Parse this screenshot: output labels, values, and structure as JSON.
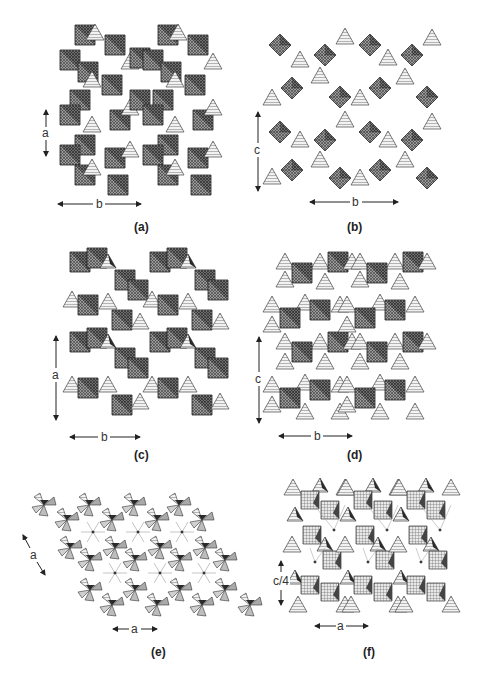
{
  "figure": {
    "panels": [
      {
        "id": "a",
        "label": "(a)",
        "axes": [
          {
            "name": "a",
            "orientation": "vertical"
          },
          {
            "name": "b",
            "orientation": "horizontal"
          }
        ],
        "style": "dense dark crosshatched octahedra with light hatched tetrahedra"
      },
      {
        "id": "b",
        "label": "(b)",
        "axes": [
          {
            "name": "c",
            "orientation": "vertical"
          },
          {
            "name": "b",
            "orientation": "horizontal"
          }
        ],
        "style": "isolated crosshatched octahedra linked by hatched triangular tetrahedra"
      },
      {
        "id": "c",
        "label": "(c)",
        "axes": [
          {
            "name": "a",
            "orientation": "vertical"
          },
          {
            "name": "b",
            "orientation": "horizontal"
          }
        ],
        "style": "zig-zag chains of crosshatched octahedra with hatched tetrahedra"
      },
      {
        "id": "d",
        "label": "(d)",
        "axes": [
          {
            "name": "c",
            "orientation": "vertical"
          },
          {
            "name": "b",
            "orientation": "horizontal"
          }
        ],
        "style": "octahedra with dark shaded faces surrounded by light tetrahedra"
      },
      {
        "id": "e",
        "label": "(e)",
        "axes": [
          {
            "name": "a",
            "orientation": "diagonal"
          },
          {
            "name": "a",
            "orientation": "horizontal"
          }
        ],
        "style": "hexagonal framework of pinwheel tetrahedral clusters"
      },
      {
        "id": "f",
        "label": "(f)",
        "axes": [
          {
            "name": "c/4",
            "orientation": "vertical"
          },
          {
            "name": "a",
            "orientation": "horizontal"
          }
        ],
        "style": "layered framework with square-grid polyhedra and central atoms"
      }
    ]
  },
  "colors": {
    "background": "#ffffff",
    "octahedron_fill": "#8a8a8a",
    "tetrahedron_fill": "#d8d8d8",
    "dark_face": "#2a2a2a",
    "line": "#222222"
  }
}
